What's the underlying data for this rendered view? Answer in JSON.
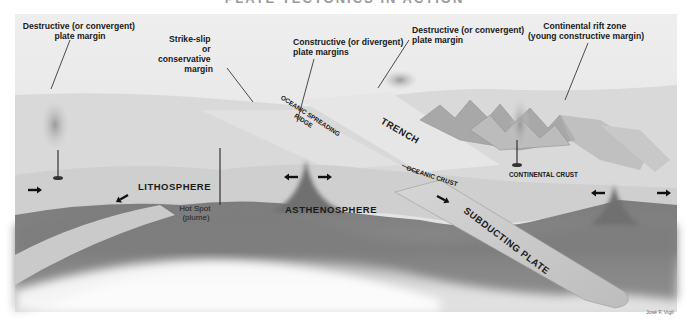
{
  "title": "PLATE TECTONICS IN ACTION",
  "labels": {
    "destructive_left": [
      "Destructive (or convergent)",
      "plate margin"
    ],
    "strike_slip": [
      "Strike-slip",
      "or",
      "conservative",
      "margin"
    ],
    "constructive": [
      "Constructive (or divergent)",
      "plate margins"
    ],
    "destructive_right": [
      "Destructive (or convergent)",
      "plate margin"
    ],
    "rift": [
      "Continental rift zone",
      "(young constructive margin)"
    ],
    "oceanic_ridge": [
      "OCEANIC SPREADING",
      "RIDGE"
    ],
    "trench": "TRENCH",
    "oceanic_crust": "OCEANIC CRUST",
    "continental_crust": "CONTINENTAL CRUST",
    "lithosphere": "LITHOSPHERE",
    "asthenosphere": "ASTHENOSPHERE",
    "hot_spot": [
      "Hot Spot",
      "(plume)"
    ],
    "subducting_plate": "SUBDUCTING PLATE"
  },
  "credit": "José F. Vigil",
  "palette": {
    "sky": "#ececec",
    "surface": "#d8d8d8",
    "lithosphere": "#cfcfcf",
    "asthenosphere": "#7a7a7a",
    "slab": "#c4c4c4",
    "ink": "#1a1a1a"
  }
}
